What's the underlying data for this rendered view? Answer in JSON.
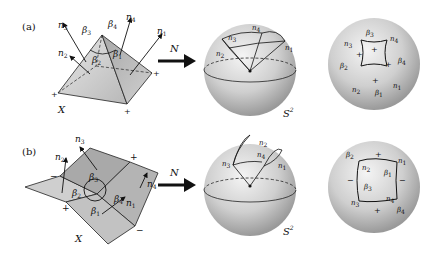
{
  "figure": {
    "panels": [
      {
        "id": "a",
        "label": "(a)",
        "surface_label": "X",
        "map_label": "N",
        "sphere_label": "S",
        "sphere_exp": "2",
        "normals": [
          "n1",
          "n2",
          "n3",
          "n4"
        ],
        "angles": [
          "β1",
          "β2",
          "β3",
          "β4"
        ],
        "vertex_signs": [
          "+",
          "+",
          "+",
          "+"
        ]
      },
      {
        "id": "b",
        "label": "(b)",
        "surface_label": "X",
        "map_label": "N",
        "sphere_label": "S",
        "sphere_exp": "2",
        "normals": [
          "n1",
          "n2",
          "n3",
          "n4"
        ],
        "angles": [
          "β1",
          "β2",
          "β3",
          "β4"
        ],
        "vertex_signs": [
          "+",
          "−",
          "+",
          "−"
        ]
      }
    ],
    "symbols": {
      "n": "n",
      "beta": "β",
      "plus": "+",
      "minus": "−",
      "sub1": "1",
      "sub2": "2",
      "sub3": "3",
      "sub4": "4"
    }
  }
}
